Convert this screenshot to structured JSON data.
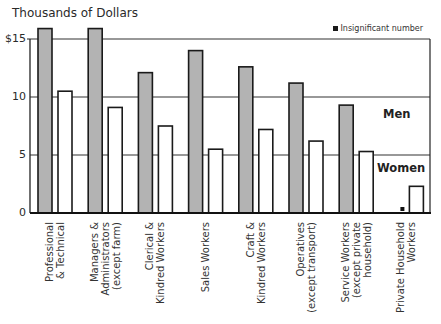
{
  "chart_data": {
    "type": "bar",
    "title": "Thousands of Dollars",
    "xlabel": "",
    "ylabel": "Thousands of Dollars",
    "ylim": [
      0,
      15
    ],
    "yticks": [
      {
        "value": 0,
        "label": "0"
      },
      {
        "value": 5,
        "label": "5"
      },
      {
        "value": 10,
        "label": "10"
      },
      {
        "value": 15,
        "label": "$15"
      }
    ],
    "grid": "horizontal lines at 5, 10, 15 (partial, behind bars)",
    "categories": [
      "Professional & Technical",
      "Managers & Administrators (except farm)",
      "Clerical & Kindred Workers",
      "Sales Workers",
      "Craft & Kindred Workers",
      "Operatives (except transport)",
      "Service Workers (except private household)",
      "Private Household Workers"
    ],
    "category_lines": [
      [
        "Professional",
        "& Technical"
      ],
      [
        "Managers &",
        "Administrators",
        "(except farm)"
      ],
      [
        "Clerical &",
        "Kindred Workers"
      ],
      [
        "Sales Workers"
      ],
      [
        "Craft &",
        "Kindred Workers"
      ],
      [
        "Operatives",
        "(except transport)"
      ],
      [
        "Service Workers",
        "(except private",
        "household)"
      ],
      [
        "Private Household",
        "Workers"
      ]
    ],
    "series": [
      {
        "name": "Men",
        "color": "#b3b3b3",
        "values": [
          15.9,
          15.9,
          12.1,
          14.0,
          12.6,
          11.2,
          9.3,
          null
        ]
      },
      {
        "name": "Women",
        "color": "#ffffff",
        "values": [
          10.5,
          9.1,
          7.5,
          5.5,
          7.2,
          6.2,
          5.3,
          2.3
        ]
      }
    ],
    "annotations": [
      {
        "text": "Men",
        "position": "right side, between 10 and 5 lines"
      },
      {
        "text": "Women",
        "position": "right side, below 5 line"
      },
      {
        "text": "Insignificant number",
        "marker": "black square",
        "position": "top right legend"
      }
    ],
    "insignificant_marker_category": "Private Household Workers",
    "legend": {
      "text": "Insignificant number",
      "position": "top-right"
    }
  },
  "labels": {
    "title": "Thousands of Dollars",
    "men": "Men",
    "women": "Women",
    "legend": "Insignificant number"
  }
}
